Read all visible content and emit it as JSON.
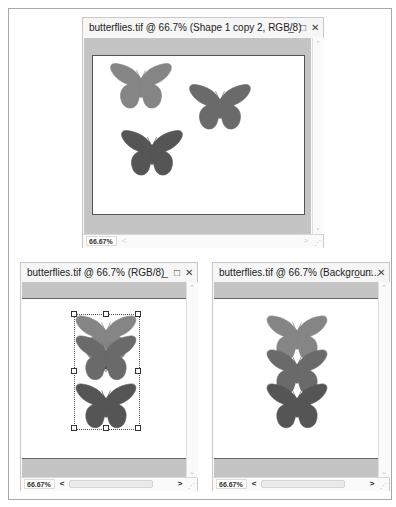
{
  "windows": [
    {
      "id": "top",
      "title": "butterflies.tif @ 66.7% (Shape 1 copy 2, RGB/8)",
      "controls": {
        "minimize": "_",
        "maximize": "□",
        "close": "✕"
      },
      "zoom_level": "66.67%",
      "scroll_arrows": {
        "up": "⌃",
        "down": "⌄",
        "left": "<",
        "right": ">"
      }
    },
    {
      "id": "bottom-left",
      "title": "butterflies.tif @ 66.7% (RGB/8)",
      "controls": {
        "minimize": "_",
        "maximize": "□",
        "close": "✕"
      },
      "zoom_level": "66.67%",
      "scroll_arrows": {
        "up": "⌃",
        "down": "⌄",
        "left": "<",
        "right": ">"
      }
    },
    {
      "id": "bottom-right",
      "title": "butterflies.tif @ 66.7% (Backgroun...",
      "controls": {
        "minimize": "_",
        "maximize": "□",
        "close": "✕"
      },
      "zoom_level": "66.67%",
      "scroll_arrows": {
        "up": "⌃",
        "down": "⌄",
        "left": "<",
        "right": ">"
      }
    }
  ],
  "colors": {
    "butterfly_light": "#858585",
    "butterfly_mid": "#6a6a6a",
    "butterfly_dark": "#555555",
    "pasteboard": "#c4c4c4"
  }
}
